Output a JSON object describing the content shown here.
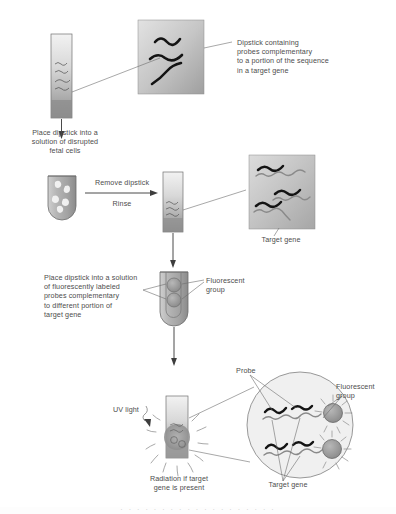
{
  "figure": {
    "background_color": "#ffffff",
    "text_color": "#4d4d4d",
    "probe_color": "#111111",
    "target_gene_color": "#8a8a8a",
    "fluorescent_group_color": "#9a9a9a"
  },
  "labels": {
    "dipstick_callout": "Dipstick containing\nprobes complementary\nto a portion of the sequence\nin a target gene",
    "place_dipstick_fetal": "Place dipstick into a\nsolution of disrupted\nfetal cells",
    "remove_dipstick": "Remove dipstick",
    "rinse": "Rinse",
    "target_gene_top": "Target gene",
    "place_dipstick_fluorescent": "Place dipstick into a solution\nof fluorescently labeled\nprobes complementary\nto different portion of\ntarget gene",
    "fluorescent_group_mid": "Fluorescent\ngroup",
    "uv_light": "UV light",
    "radiation": "Radiation if target\ngene is present",
    "probe": "Probe",
    "fluorescent_group_bottom": "Fluorescent\ngroup",
    "target_gene_bottom": "Target gene",
    "cut_off_caption": "·  ·  ·  ·  ·  ·  ·  ·  ·  ·  ·  ·  ·  ·  ·  ·  ·  ·  ·"
  },
  "steps": [
    {
      "id": "step-1",
      "name": "dipstick-with-probes",
      "caption": "Dipstick containing probes complementary to a portion of the sequence in a target gene"
    },
    {
      "id": "step-2",
      "name": "place-in-fetal-cell-solution",
      "caption": "Place dipstick into a solution of disrupted fetal cells"
    },
    {
      "id": "step-3",
      "name": "remove-and-rinse",
      "caption": "Remove dipstick, Rinse"
    },
    {
      "id": "step-4",
      "name": "hybridized-target-gene",
      "caption": "Target gene"
    },
    {
      "id": "step-5",
      "name": "place-in-fluorescent-probe-solution",
      "caption": "Place dipstick into a solution of fluorescently labeled probes complementary to different portion of target gene"
    },
    {
      "id": "step-6",
      "name": "uv-illumination-readout",
      "caption": "Radiation if target gene is present"
    }
  ]
}
